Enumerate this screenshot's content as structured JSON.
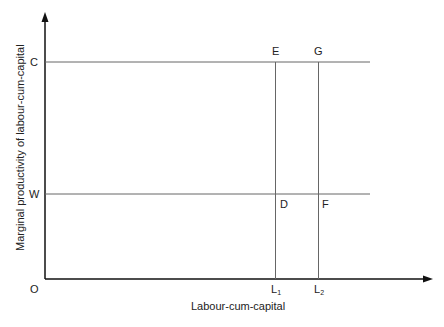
{
  "diagram": {
    "y_axis_label": "Marginal productivity of labour-cum-capital",
    "x_axis_label": "Labour-cum-capital",
    "origin": "O",
    "y_ticks": {
      "c": "C",
      "w": "W"
    },
    "points": {
      "e": "E",
      "g": "G",
      "d": "D",
      "f": "F"
    },
    "x_ticks": {
      "l1": "L",
      "l1_sub": "1",
      "l2": "L",
      "l2_sub": "2"
    }
  }
}
